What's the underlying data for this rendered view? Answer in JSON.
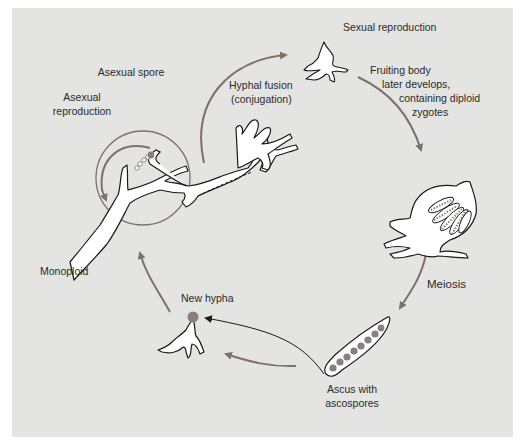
{
  "diagram": {
    "type": "life-cycle",
    "colors": {
      "background": "#e4e4e2",
      "frame": "#ffffff",
      "arrow": "#7c716c",
      "outline": "#1a1a1a",
      "hypha_fill": "#ffffff",
      "spore": "#8a7f7a",
      "text": "#2a2a2a"
    },
    "labels": {
      "asexual_spore": "Asexual spore",
      "asexual_reproduction_line1": "Asexual",
      "asexual_reproduction_line2": "reproduction",
      "hyphal_fusion_line1": "Hyphal fusion",
      "hyphal_fusion_line2": "(conjugation)",
      "sexual_reproduction": "Sexual reproduction",
      "fruiting_body_line1": "Fruiting body",
      "fruiting_body_line2": "later develops,",
      "fruiting_body_line3": "containing diploid",
      "fruiting_body_line4": "zygotes",
      "meiosis": "Meiosis",
      "ascus_line1": "Ascus with",
      "ascus_line2": "ascospores",
      "new_hypha": "New hypha",
      "monoploid": "Monoploid"
    },
    "nodes": [
      {
        "id": "monoploid-mycelium",
        "label": "Monoploid"
      },
      {
        "id": "asexual-reproduction",
        "label": "Asexual reproduction"
      },
      {
        "id": "hyphal-fusion",
        "label": "Hyphal fusion (conjugation)"
      },
      {
        "id": "sexual-reproduction",
        "label": "Sexual reproduction"
      },
      {
        "id": "fruiting-body",
        "label": "Fruiting body later develops, containing diploid zygotes"
      },
      {
        "id": "meiosis",
        "label": "Meiosis"
      },
      {
        "id": "ascus",
        "label": "Ascus with ascospores"
      },
      {
        "id": "new-hypha",
        "label": "New hypha"
      }
    ],
    "edges": [
      {
        "from": "monoploid-mycelium",
        "to": "sexual-reproduction",
        "via": "Hyphal fusion (conjugation)"
      },
      {
        "from": "sexual-reproduction",
        "to": "fruiting-body"
      },
      {
        "from": "fruiting-body",
        "to": "ascus",
        "via": "Meiosis"
      },
      {
        "from": "ascus",
        "to": "new-hypha"
      },
      {
        "from": "new-hypha",
        "to": "monoploid-mycelium"
      },
      {
        "from": "monoploid-mycelium",
        "to": "monoploid-mycelium",
        "via": "Asexual reproduction"
      }
    ],
    "ascospore_count": 8
  }
}
